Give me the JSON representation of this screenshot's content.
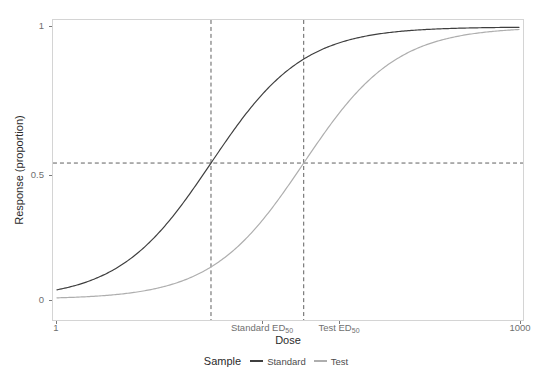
{
  "chart_data": {
    "type": "line",
    "title": "",
    "subtitle": "",
    "xlabel": "Dose",
    "ylabel": "Response (proportion)",
    "xscale": "log",
    "xlim": [
      1,
      1000
    ],
    "ylim": [
      0,
      1
    ],
    "grid": false,
    "panel_background": "#ffffff",
    "panel_border": "#d4d4d4",
    "legend_position": "bottom",
    "legend_title": "Sample",
    "x_ticks": [
      {
        "value": 1,
        "label": "1",
        "pixel_x": 56
      },
      {
        "value": 10,
        "label": "Standard ED50",
        "label_base": "Standard ED",
        "label_sub": "50",
        "pixel_x": 262
      },
      {
        "value": 40,
        "label": "Test ED50",
        "label_base": "Test ED",
        "label_sub": "50",
        "pixel_x": 339
      },
      {
        "value": 1000,
        "label": "1000",
        "pixel_x": 520
      }
    ],
    "y_ticks": [
      {
        "value": 0,
        "label": "0",
        "pixel_y": 300
      },
      {
        "value": 0.5,
        "label": "0.5",
        "pixel_y": 175
      },
      {
        "value": 1,
        "label": "1",
        "pixel_y": 26
      }
    ],
    "reference_lines": [
      {
        "orientation": "horizontal",
        "value": 0.5,
        "style": "dashed",
        "color": "#4d4d4d"
      },
      {
        "orientation": "vertical",
        "value": 10,
        "style": "dashed",
        "color": "#4d4d4d",
        "label": "Standard ED50"
      },
      {
        "orientation": "vertical",
        "value": 40,
        "style": "dashed",
        "color": "#4d4d4d",
        "label": "Test ED50"
      }
    ],
    "series": [
      {
        "name": "Standard",
        "color": "#3f3f3f",
        "ed50": 10,
        "slope": 1.0,
        "x": [
          1,
          1.6,
          2.5,
          4,
          6.3,
          10,
          16,
          25,
          40,
          63,
          100,
          160,
          250,
          400,
          630,
          1000
        ],
        "values": [
          0.02,
          0.05,
          0.08,
          0.13,
          0.25,
          0.5,
          0.71,
          0.84,
          0.91,
          0.95,
          0.975,
          0.985,
          0.99,
          0.993,
          0.996,
          0.998
        ]
      },
      {
        "name": "Test",
        "color": "#aeaeae",
        "ed50": 40,
        "slope": 1.0,
        "x": [
          1,
          1.6,
          2.5,
          4,
          6.3,
          10,
          16,
          25,
          40,
          63,
          100,
          160,
          250,
          400,
          630,
          1000
        ],
        "values": [
          0.01,
          0.015,
          0.025,
          0.04,
          0.07,
          0.14,
          0.23,
          0.36,
          0.5,
          0.66,
          0.78,
          0.87,
          0.93,
          0.96,
          0.98,
          0.99
        ]
      }
    ]
  },
  "axis": {
    "x_title": "Dose",
    "y_title": "Response (proportion)"
  },
  "legend": {
    "title": "Sample",
    "items": [
      {
        "label": "Standard",
        "color": "#3f3f3f"
      },
      {
        "label": "Test",
        "color": "#aeaeae"
      }
    ]
  }
}
